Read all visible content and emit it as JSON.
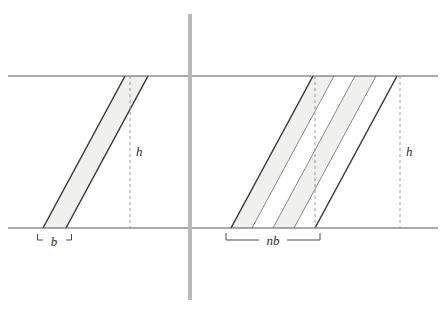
{
  "figure": {
    "background_color": "#ffffff",
    "width": 444,
    "height": 312,
    "colors": {
      "rule_line": "#555555",
      "shape_stroke": "#3a3a3a",
      "shape_stroke_light": "#8a8a8a",
      "shape_fill": "#f0f0ee",
      "divider": "#b9b9b9",
      "dashed_line": "#9a9a9a",
      "label_text": "#2b2b2b",
      "bracket": "#4a4a4a"
    },
    "guides": {
      "top_rule_y": 76,
      "bottom_rule_y": 228,
      "rule_x_start": 8,
      "rule_x_end": 438,
      "divider_x": 190,
      "divider_width": 4,
      "divider_y_start": 14,
      "divider_y_end": 300
    },
    "left_panel": {
      "name": "single-parallelogram",
      "shear_dx": 82,
      "base_label": "b",
      "height_label": "h",
      "base_left_x": 43,
      "base_right_x": 66,
      "height_dashed_x": 130,
      "base_bracket_label_x": 54,
      "base_bracket_label_y": 245,
      "height_label_x": 136,
      "height_label_y": 156
    },
    "right_panel": {
      "name": "n-parallelograms",
      "shear_dx": 82,
      "base_label": "nb",
      "height_label": "h",
      "count": 4,
      "base_left_x": 231,
      "base_right_x": 315,
      "strip_bottom_x": [
        231,
        252,
        273,
        294,
        315
      ],
      "height_dashed_x": 400,
      "inner_dashed_x": 315,
      "base_bracket_label_x": 273,
      "base_bracket_label_y": 245,
      "height_label_x": 406,
      "height_label_y": 156
    }
  }
}
